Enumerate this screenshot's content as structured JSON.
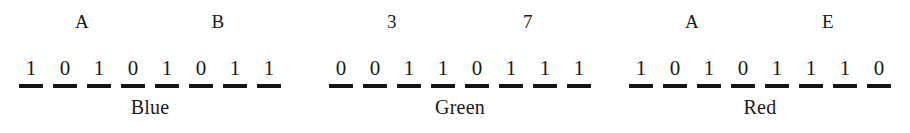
{
  "figure": {
    "text_color": "#1a1a1a",
    "background_color": "#ffffff",
    "groups": [
      {
        "caption": "Blue",
        "nibble_labels": [
          "A",
          "B"
        ],
        "bits": [
          "1",
          "0",
          "1",
          "0",
          "1",
          "0",
          "1",
          "1"
        ]
      },
      {
        "caption": "Green",
        "nibble_labels": [
          "3",
          "7"
        ],
        "bits": [
          "0",
          "0",
          "1",
          "1",
          "0",
          "1",
          "1",
          "1"
        ]
      },
      {
        "caption": "Red",
        "nibble_labels": [
          "A",
          "E"
        ],
        "bits": [
          "1",
          "0",
          "1",
          "0",
          "1",
          "1",
          "1",
          "0"
        ]
      }
    ]
  }
}
